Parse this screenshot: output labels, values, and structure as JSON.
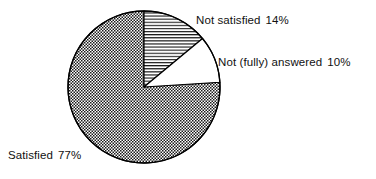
{
  "figure": {
    "name": "satisfaction-pie-chart",
    "background_color": "#ffffff",
    "stroke_color": "#000000"
  },
  "chart_data": {
    "type": "pie",
    "title": "",
    "subtitle": "",
    "xlabel": "",
    "ylabel": "",
    "legend_position": "none",
    "grid": false,
    "start_angle_deg": 0,
    "direction": "clockwise",
    "center": {
      "x": 144,
      "y": 87
    },
    "radius": 76,
    "categories": [
      "Not satisfied",
      "Not (fully) answered",
      "Satisfied"
    ],
    "values": [
      14,
      10,
      77
    ],
    "value_unit": "%",
    "slices": [
      {
        "label": "Not satisfied",
        "percent_text": "14%",
        "value": 14,
        "fill": "horizontal-lines",
        "start_deg": 0,
        "end_deg": 50.4
      },
      {
        "label": "Not (fully) answered",
        "percent_text": "10%",
        "value": 10,
        "fill": "blank",
        "start_deg": 50.4,
        "end_deg": 86.4
      },
      {
        "label": "Satisfied",
        "percent_text": "77%",
        "value": 77,
        "fill": "checkerboard",
        "start_deg": 86.4,
        "end_deg": 360
      }
    ]
  },
  "labels": {
    "not_satisfied": {
      "text": "Not satisfied",
      "percent": "14%"
    },
    "not_answered": {
      "text": "Not (fully) answered",
      "percent": "10%"
    },
    "satisfied": {
      "text": "Satisfied",
      "percent": "77%"
    }
  }
}
